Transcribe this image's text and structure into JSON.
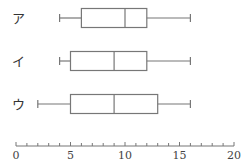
{
  "chart_data": {
    "type": "boxplot",
    "title": "",
    "xlabel": "",
    "ylabel": "",
    "xlim": [
      0,
      20
    ],
    "major_ticks": [
      0,
      5,
      10,
      15,
      20
    ],
    "tick_labels": [
      "0",
      "5",
      "10",
      "15",
      "20"
    ],
    "minor_tick_step": 1,
    "grid": false,
    "series": [
      {
        "name": "ア",
        "min": 4,
        "q1": 6,
        "median": 10,
        "q3": 12,
        "max": 16
      },
      {
        "name": "イ",
        "min": 4,
        "q1": 5,
        "median": 9,
        "q3": 12,
        "max": 16
      },
      {
        "name": "ウ",
        "min": 2,
        "q1": 5,
        "median": 9,
        "q3": 13,
        "max": 16
      }
    ],
    "colors": {
      "line": "#777777",
      "text": "#333333"
    }
  }
}
